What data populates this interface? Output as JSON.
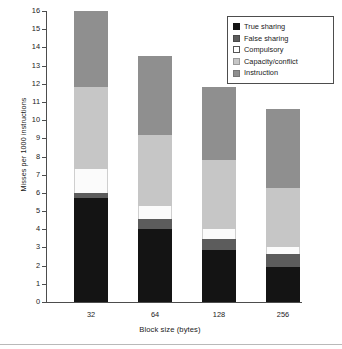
{
  "chart_data": {
    "type": "bar",
    "stacked": true,
    "title": "",
    "xlabel": "Block size (bytes)",
    "ylabel": "Misses per 1000 instructions",
    "categories": [
      "32",
      "64",
      "128",
      "256"
    ],
    "ylim": [
      0,
      16
    ],
    "ytick_labels": [
      "0",
      "1",
      "2",
      "3",
      "4",
      "5",
      "6",
      "7",
      "8",
      "9",
      "10",
      "11",
      "12",
      "13",
      "14",
      "15",
      "16"
    ],
    "grid": false,
    "legend_position": "top-right",
    "series": [
      {
        "name": "True sharing",
        "color": "#141414",
        "values": [
          5.7,
          4.0,
          2.85,
          1.9
        ]
      },
      {
        "name": "False sharing",
        "color": "#5c5c5c",
        "values": [
          0.3,
          0.55,
          0.6,
          0.75
        ]
      },
      {
        "name": "Compulsory",
        "color": "#ffffff",
        "values": [
          1.3,
          0.75,
          0.55,
          0.4
        ]
      },
      {
        "name": "Capacity/conflict",
        "color": "#c6c6c6",
        "values": [
          4.5,
          3.9,
          3.8,
          3.2
        ]
      },
      {
        "name": "Instruction",
        "color": "#8f8f8f",
        "values": [
          4.2,
          4.3,
          4.0,
          4.35
        ]
      }
    ],
    "totals": [
      16.0,
      13.5,
      11.8,
      10.6
    ]
  },
  "legend": {
    "items": [
      {
        "label": "True sharing"
      },
      {
        "label": "False sharing"
      },
      {
        "label": "Compulsory"
      },
      {
        "label": "Capacity/conflict"
      },
      {
        "label": "Instruction"
      }
    ]
  }
}
